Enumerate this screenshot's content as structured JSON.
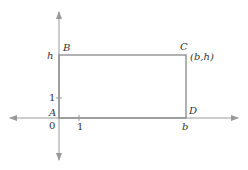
{
  "diagram": {
    "labels": {
      "B": "B",
      "C": "C",
      "C_coord": "(b,h)",
      "A": "A",
      "D": "D",
      "h": "h",
      "b": "b",
      "origin": "0",
      "y_tick": "1",
      "x_tick": "1"
    },
    "colors": {
      "axis": "#999999",
      "rect": "#888888",
      "text": "#333333"
    }
  }
}
